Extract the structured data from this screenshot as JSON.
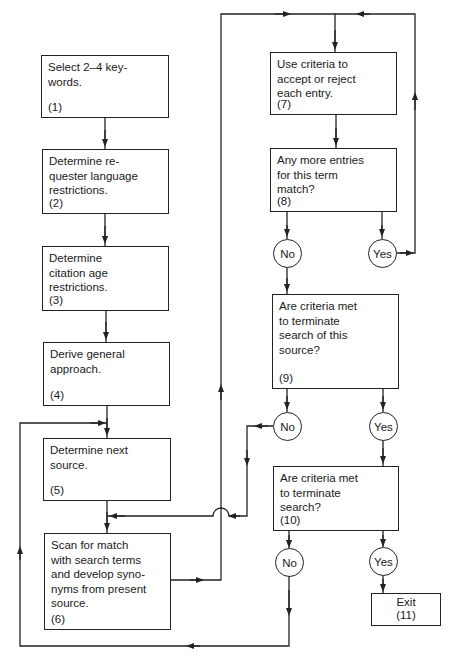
{
  "diagram": {
    "type": "flowchart",
    "colors": {
      "line": "#222222",
      "background": "#ffffff"
    },
    "nodes": [
      {
        "id": "1",
        "text": "Select 2–4 key-\nwords.",
        "number": "(1)"
      },
      {
        "id": "2",
        "text": "Determine re-\nquester language\nrestrictions.",
        "number": "(2)"
      },
      {
        "id": "3",
        "text": "Determine\ncitation age\nrestrictions.",
        "number": "(3)"
      },
      {
        "id": "4",
        "text": "Derive general\napproach.",
        "number": "(4)"
      },
      {
        "id": "5",
        "text": "Determine next\nsource.",
        "number": "(5)"
      },
      {
        "id": "6",
        "text": "Scan for match\nwith search terms\nand develop syno-\nnyms from present\nsource.",
        "number": "(6)"
      },
      {
        "id": "7",
        "text": "Use criteria to\naccept or reject\neach entry.",
        "number": "(7)"
      },
      {
        "id": "8",
        "text": "Any more entries\nfor this term\nmatch?",
        "number": "(8)"
      },
      {
        "id": "9",
        "text": "Are criteria met\nto terminate\nsearch of this\nsource?",
        "number": "(9)"
      },
      {
        "id": "10",
        "text": "Are criteria met\nto terminate\nsearch?",
        "number": "(10)"
      },
      {
        "id": "11",
        "text": "Exit",
        "number": "(11)"
      }
    ],
    "decisions": {
      "d8_no": "No",
      "d8_yes": "Yes",
      "d9_no": "No",
      "d9_yes": "Yes",
      "d10_no": "No",
      "d10_yes": "Yes"
    },
    "edges": [
      {
        "from": "1",
        "to": "2"
      },
      {
        "from": "2",
        "to": "3"
      },
      {
        "from": "3",
        "to": "4"
      },
      {
        "from": "4",
        "to": "5"
      },
      {
        "from": "5",
        "to": "6"
      },
      {
        "from": "6",
        "to": "7"
      },
      {
        "from": "7",
        "to": "8"
      },
      {
        "from": "8",
        "to": "9",
        "label": "No"
      },
      {
        "from": "8",
        "to": "7",
        "label": "Yes"
      },
      {
        "from": "9",
        "to": "6",
        "label": "No"
      },
      {
        "from": "9",
        "to": "10",
        "label": "Yes"
      },
      {
        "from": "10",
        "to": "5",
        "label": "No"
      },
      {
        "from": "10",
        "to": "11",
        "label": "Yes"
      }
    ]
  }
}
